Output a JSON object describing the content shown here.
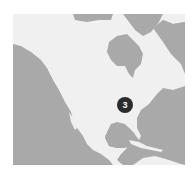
{
  "map": {
    "region": "North America",
    "colors": {
      "water": "#a9a9a9",
      "land": "#f0f0f0",
      "marker": "#2b2b2b",
      "marker_text": "#ffffff"
    }
  },
  "markers": [
    {
      "count": "3",
      "location": "Southeastern United States"
    }
  ]
}
